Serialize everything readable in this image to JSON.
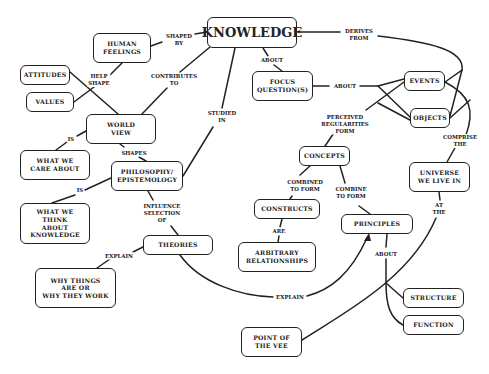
{
  "diagram": {
    "type": "concept-map",
    "nodes": {
      "knowledge": "KNOWLEDGE",
      "human_feelings": "HUMAN\nFEELINGS",
      "attitudes": "ATTITUDES",
      "values": "VALUES",
      "world_view": "WORLD\nVIEW",
      "what_we_care_about": "WHAT WE\nCARE ABOUT",
      "philosophy": "PHILOSOPHY/\nEPISTEMOLOGY",
      "what_we_think": "WHAT WE\nTHINK\nABOUT\nKNOWLEDGE",
      "theories": "THEORIES",
      "why_things": "WHY THINGS\nARE OR\nWHY THEY WORK",
      "focus_questions": "FOCUS\nQUESTION(S)",
      "events": "EVENTS",
      "objects": "OBJECTS",
      "concepts": "CONCEPTS",
      "constructs": "CONSTRUCTS",
      "arbitrary_relationships": "ARBITRARY\nRELATIONSHIPS",
      "principles": "PRINCIPLES",
      "universe": "UNIVERSE\nWE LIVE IN",
      "structure": "STRUCTURE",
      "function": "FUNCTION",
      "point_of_vee": "POINT OF\nTHE VEE"
    },
    "links": {
      "shaped_by": "SHAPED\nBY",
      "help_shape": "HELP\nSHAPE",
      "contributes_to": "CONTRIBUTES\nTO",
      "studied_in": "STUDIED\nIN",
      "about_kq": "ABOUT",
      "derives_from": "DERIVES\nFROM",
      "about_fq": "ABOUT",
      "is_care": "IS",
      "shapes": "SHAPES",
      "is_think": "IS",
      "influence_selection_of": "INFLUENCE\nSELECTION\nOF",
      "explain_why": "EXPLAIN",
      "perceived_regularities_form": "PERCEIVED\nREGULARITIES\nFORM",
      "comprise_the": "COMPRISE\nTHE",
      "combined_to_form": "COMBINED\nTO FORM",
      "combine_to_form": "COMBINE\nTO FORM",
      "are": "ARE",
      "at_the": "AT\nTHE",
      "about_principles": "ABOUT",
      "explain_principles": "EXPLAIN"
    }
  }
}
